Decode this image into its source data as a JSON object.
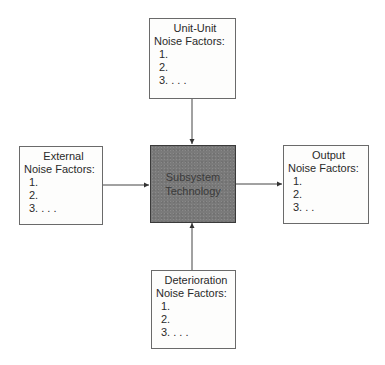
{
  "diagram": {
    "center": {
      "lines": [
        "Subsystem",
        "Technology"
      ],
      "fill": "#7a7a7a"
    },
    "top": {
      "title": [
        "Unit-Unit",
        "Noise Factors:"
      ],
      "items": [
        "1.",
        "2.",
        "3. . . ."
      ]
    },
    "left": {
      "title": [
        "External",
        "Noise Factors:"
      ],
      "items": [
        "1.",
        "2.",
        "3. . . ."
      ]
    },
    "right": {
      "title": [
        "Output",
        "Noise Factors:"
      ],
      "items": [
        "1.",
        "2.",
        "3. . ."
      ]
    },
    "bottom": {
      "title": [
        "Deterioration",
        "Noise Factors:"
      ],
      "items": [
        "1.",
        "2.",
        "3. . . ."
      ]
    },
    "arrows": [
      {
        "from": "top",
        "to": "center"
      },
      {
        "from": "left",
        "to": "center"
      },
      {
        "from": "bottom",
        "to": "center"
      },
      {
        "from": "center",
        "to": "right"
      }
    ]
  }
}
